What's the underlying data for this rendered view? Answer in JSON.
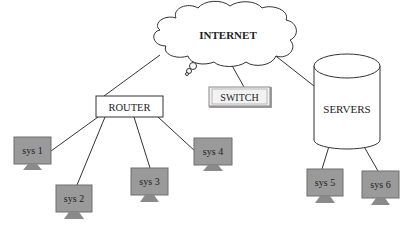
{
  "diagram": {
    "type": "network-topology",
    "colors": {
      "line": "#333333",
      "monitor_fill": "#9a9a9a",
      "monitor_stroke": "#6e6e6e",
      "switch_fill": "#f2f2f2",
      "switch_shadow": "#9c9c9c",
      "background": "#ffffff"
    },
    "nodes": {
      "internet": {
        "label": "INTERNET",
        "shape": "cloud"
      },
      "router": {
        "label": "ROUTER",
        "shape": "rectangle"
      },
      "switch": {
        "label": "SWITCH",
        "shape": "beveled-button"
      },
      "servers": {
        "label": "SERVERS",
        "shape": "cylinder"
      },
      "sys1": {
        "label": "sys 1",
        "shape": "monitor"
      },
      "sys2": {
        "label": "sys 2",
        "shape": "monitor"
      },
      "sys3": {
        "label": "sys 3",
        "shape": "monitor"
      },
      "sys4": {
        "label": "sys 4",
        "shape": "monitor"
      },
      "sys5": {
        "label": "sys 5",
        "shape": "monitor"
      },
      "sys6": {
        "label": "sys 6",
        "shape": "monitor"
      }
    },
    "edges": [
      {
        "from": "internet",
        "to": "router"
      },
      {
        "from": "internet",
        "to": "switch"
      },
      {
        "from": "internet",
        "to": "servers"
      },
      {
        "from": "router",
        "to": "sys1"
      },
      {
        "from": "router",
        "to": "sys2"
      },
      {
        "from": "router",
        "to": "sys3"
      },
      {
        "from": "router",
        "to": "sys4"
      },
      {
        "from": "servers",
        "to": "sys5"
      },
      {
        "from": "servers",
        "to": "sys6"
      }
    ]
  }
}
